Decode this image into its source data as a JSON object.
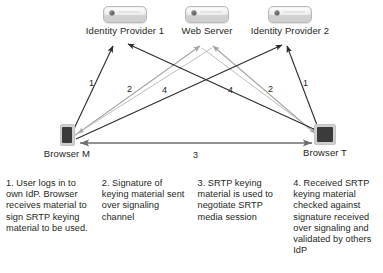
{
  "diagram": {
    "nodes": [
      {
        "id": "idp1",
        "label": "Identity Provider 1",
        "type": "server",
        "x": 125,
        "y": 12
      },
      {
        "id": "webserver",
        "label": "Web Server",
        "type": "server",
        "x": 207,
        "y": 12
      },
      {
        "id": "idp2",
        "label": "Identity Provider 2",
        "type": "server",
        "x": 290,
        "y": 12
      },
      {
        "id": "browserm",
        "label": "Browser M",
        "type": "browser",
        "x": 67,
        "y": 130
      },
      {
        "id": "browsert",
        "label": "Browser T",
        "type": "browser",
        "x": 325,
        "y": 130
      }
    ],
    "wire_labels": [
      {
        "id": "label-1-left",
        "text": "1",
        "x": 89,
        "y": 78
      },
      {
        "id": "label-2-left",
        "text": "2",
        "x": 127,
        "y": 84
      },
      {
        "id": "label-4-left",
        "text": "4",
        "x": 162,
        "y": 85
      },
      {
        "id": "label-4-right",
        "text": "4",
        "x": 228,
        "y": 85
      },
      {
        "id": "label-2-right",
        "text": "2",
        "x": 268,
        "y": 84
      },
      {
        "id": "label-1-right",
        "text": "1",
        "x": 303,
        "y": 78
      },
      {
        "id": "label-3-mid",
        "text": "3",
        "x": 193,
        "y": 158
      }
    ],
    "colors": {
      "dark_arrow": "#2b2b2b",
      "light_arrow": "#a6a6a6",
      "mid_arrow": "#6e6e6e",
      "text": "#231f20",
      "background": "#ffffff"
    }
  },
  "captions": [
    {
      "id": "step-1",
      "text": "1. User logs in to own IdP. Browser receives material to sign SRTP keying material to be used."
    },
    {
      "id": "step-2",
      "text": "2. Signature of keying material sent over signaling channel"
    },
    {
      "id": "step-3",
      "text": "3. SRTP keying material is used to negotiate SRTP media session"
    },
    {
      "id": "step-4",
      "text": "4. Received SRTP keying material checked against signature received over signaling and validated by others IdP"
    }
  ]
}
